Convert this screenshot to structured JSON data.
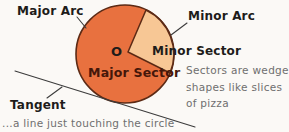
{
  "figure": {
    "labels": {
      "major_arc": "Major Arc",
      "minor_arc": "Minor Arc",
      "center": "O",
      "minor_sector": "Minor Sector",
      "major_sector": "Major Sector",
      "tangent": "Tangent"
    },
    "notes": {
      "tangent_note": "...a line just touching the circle",
      "sector_note": [
        "Sectors are wedge",
        "shapes like slices",
        "of pizza"
      ]
    },
    "colors": {
      "background": "#fbf9f6",
      "major_sector_fill": "#e8713f",
      "minor_sector_fill": "#f7c795",
      "outline": "#5c2a15",
      "label_text": "#1e1c1a",
      "major_sector_text": "#45170a",
      "note_text": "#6f6f6f",
      "line": "#3c3c3c"
    }
  }
}
